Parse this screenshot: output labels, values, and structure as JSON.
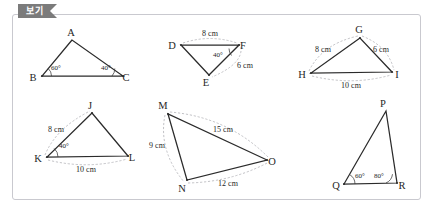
{
  "panel": {
    "tab_label": "보기"
  },
  "colors": {
    "tab_background": "#7b7b7b",
    "panel_border": "#c9c9cf",
    "stroke": "#2b2b2b",
    "dash": "#b3b3b8",
    "page_background": "#ffffff"
  },
  "figures": [
    {
      "id": "triangle-abc",
      "vertices": [
        {
          "name": "A",
          "label": "A",
          "x": 72,
          "y": 40,
          "lx": 71,
          "ly": 36
        },
        {
          "name": "B",
          "label": "B",
          "x": 42,
          "y": 76,
          "lx": 33,
          "ly": 81
        },
        {
          "name": "C",
          "label": "C",
          "x": 123,
          "y": 76,
          "lx": 126,
          "ly": 81
        }
      ],
      "angles": [
        {
          "at": "B",
          "value": "60°",
          "lx": 51,
          "ly": 70
        },
        {
          "at": "C",
          "value": "40°",
          "lx": 101,
          "ly": 70
        }
      ],
      "lengths": []
    },
    {
      "id": "triangle-def",
      "vertices": [
        {
          "name": "D",
          "label": "D",
          "x": 181,
          "y": 45,
          "lx": 172,
          "ly": 49
        },
        {
          "name": "E",
          "label": "E",
          "x": 209,
          "y": 75,
          "lx": 206,
          "ly": 86
        },
        {
          "name": "F",
          "label": "F",
          "x": 239,
          "y": 45,
          "lx": 241,
          "ly": 49
        }
      ],
      "angles": [
        {
          "at": "F",
          "value": "40°",
          "lx": 213,
          "ly": 54
        }
      ],
      "lengths": [
        {
          "edge": "DF",
          "value": "8 cm",
          "lx": 198,
          "ly": 37
        },
        {
          "edge": "FE",
          "value": "6 cm",
          "lx": 234,
          "ly": 68
        }
      ]
    },
    {
      "id": "triangle-ghi",
      "vertices": [
        {
          "name": "G",
          "label": "G",
          "x": 360,
          "y": 38,
          "lx": 357,
          "ly": 33
        },
        {
          "name": "H",
          "label": "H",
          "x": 311,
          "y": 73,
          "lx": 301,
          "ly": 78
        },
        {
          "name": "I",
          "label": "I",
          "x": 392,
          "y": 72,
          "lx": 396,
          "ly": 78
        }
      ],
      "angles": [],
      "lengths": [
        {
          "edge": "HG",
          "value": "8 cm",
          "lx": 315,
          "ly": 51
        },
        {
          "edge": "GI",
          "value": "6 cm",
          "lx": 375,
          "ly": 51
        },
        {
          "edge": "HI",
          "value": "10 cm",
          "lx": 339,
          "ly": 86
        }
      ]
    },
    {
      "id": "triangle-jkl",
      "vertices": [
        {
          "name": "J",
          "label": "J",
          "x": 92,
          "y": 113,
          "lx": 89,
          "ly": 108
        },
        {
          "name": "K",
          "label": "K",
          "x": 47,
          "y": 157,
          "lx": 37,
          "ly": 162
        },
        {
          "name": "L",
          "label": "L",
          "x": 128,
          "y": 156,
          "lx": 131,
          "ly": 161
        }
      ],
      "angles": [
        {
          "at": "K",
          "value": "40°",
          "lx": 57,
          "ly": 150
        }
      ],
      "lengths": [
        {
          "edge": "KJ",
          "value": "8 cm",
          "lx": 49,
          "ly": 129
        },
        {
          "edge": "KL",
          "value": "10 cm",
          "lx": 75,
          "ly": 170
        }
      ]
    },
    {
      "id": "triangle-mno",
      "vertices": [
        {
          "name": "M",
          "label": "M",
          "x": 168,
          "y": 114,
          "lx": 163,
          "ly": 108
        },
        {
          "name": "N",
          "label": "N",
          "x": 187,
          "y": 180,
          "lx": 181,
          "ly": 191
        },
        {
          "name": "O",
          "label": "O",
          "x": 267,
          "y": 160,
          "lx": 270,
          "ly": 165
        }
      ],
      "angles": [],
      "lengths": [
        {
          "edge": "MO",
          "value": "15 cm",
          "lx": 212,
          "ly": 131
        },
        {
          "edge": "MN",
          "value": "9 cm",
          "lx": 158,
          "ly": 146
        },
        {
          "edge": "NO",
          "value": "12 cm",
          "lx": 218,
          "ly": 184
        }
      ]
    },
    {
      "id": "triangle-pqr",
      "vertices": [
        {
          "name": "P",
          "label": "P",
          "x": 386,
          "y": 111,
          "lx": 383,
          "ly": 106
        },
        {
          "name": "Q",
          "label": "Q",
          "x": 344,
          "y": 184,
          "lx": 334,
          "ly": 189
        },
        {
          "name": "R",
          "label": "R",
          "x": 397,
          "y": 183,
          "lx": 400,
          "ly": 189
        }
      ],
      "angles": [
        {
          "at": "Q",
          "value": "60°",
          "lx": 352,
          "ly": 178
        },
        {
          "at": "R",
          "value": "80°",
          "lx": 375,
          "ly": 178
        }
      ],
      "lengths": []
    }
  ]
}
